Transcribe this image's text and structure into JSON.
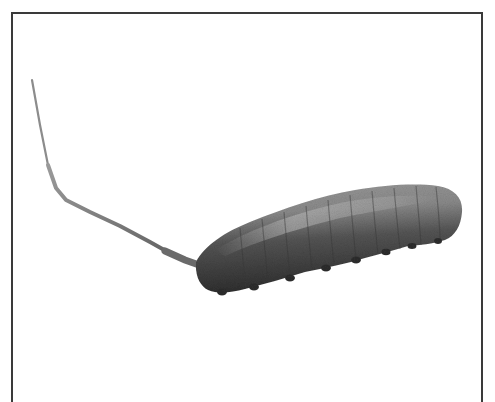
{
  "figure": {
    "icon": "larva-illustration",
    "colors": {
      "frame": "#3a3a3a",
      "body_dark": "#3c3c3c",
      "body_mid": "#6a6a6a",
      "body_light": "#a8a8a8",
      "tail": "#7a7a7a",
      "background": "#ffffff"
    }
  },
  "side_caption": {
    "text": "· · ·   ·   ·   · · · ·"
  }
}
